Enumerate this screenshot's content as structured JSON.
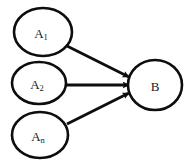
{
  "diagram": {
    "type": "directed-graph",
    "background_color": "#ffffff",
    "stroke_color": "#0d0d0d",
    "nodes": [
      {
        "id": "a1",
        "label_base": "A",
        "label_subscript": "1",
        "label_full": "A₁",
        "shape": "ellipse",
        "cx": 43,
        "cy": 32,
        "rx": 29,
        "ry": 24
      },
      {
        "id": "a2",
        "label_base": "A",
        "label_subscript": "2",
        "label_full": "A₂",
        "shape": "ellipse",
        "cx": 39,
        "cy": 83,
        "rx": 27,
        "ry": 21
      },
      {
        "id": "an",
        "label_base": "A",
        "label_subscript": "n",
        "label_full": "Aₙ",
        "shape": "ellipse",
        "cx": 40,
        "cy": 135,
        "rx": 28,
        "ry": 23
      },
      {
        "id": "b",
        "label_base": "B",
        "label_subscript": "",
        "label_full": "B",
        "shape": "ellipse",
        "cx": 155,
        "cy": 85,
        "rx": 27,
        "ry": 25
      }
    ],
    "edges": [
      {
        "id": "edge-a1-b",
        "from": "a1",
        "to": "b",
        "x1": 67,
        "y1": 46,
        "x2": 129,
        "y2": 77,
        "arrowhead": "solid-triangle"
      },
      {
        "id": "edge-a2-b",
        "from": "a2",
        "to": "b",
        "x1": 66,
        "y1": 85,
        "x2": 129,
        "y2": 85,
        "arrowhead": "solid-triangle"
      },
      {
        "id": "edge-an-b",
        "from": "an",
        "to": "b",
        "x1": 67,
        "y1": 124,
        "x2": 129,
        "y2": 93,
        "arrowhead": "solid-triangle"
      }
    ]
  }
}
